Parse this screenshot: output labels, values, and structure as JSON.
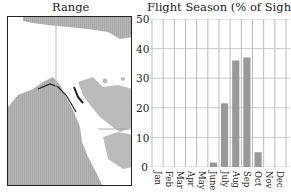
{
  "panels": {
    "range": {
      "title": "Range"
    },
    "flight_season": {
      "title": "Flight Season (% of Sightings)"
    }
  },
  "colors": {
    "bar": "#999999",
    "land_range": "#bbbbbb",
    "grid": "#cccccc",
    "border": "#222222"
  },
  "chart_data": {
    "type": "bar",
    "title": "Flight Season (% of Sightings)",
    "xlabel": "",
    "ylabel": "% of Sightings",
    "categories": [
      "Jan",
      "Feb",
      "Mar",
      "Apr",
      "May",
      "June",
      "July",
      "Aug",
      "Sep",
      "Oct",
      "Nov",
      "Dec"
    ],
    "values": [
      0,
      0,
      0,
      0,
      0,
      1.5,
      21.5,
      36,
      37,
      5,
      0,
      0
    ],
    "yticks": [
      0,
      10,
      20,
      30,
      40,
      50
    ],
    "ylim": [
      0,
      50
    ],
    "grid": true,
    "legend": null
  }
}
